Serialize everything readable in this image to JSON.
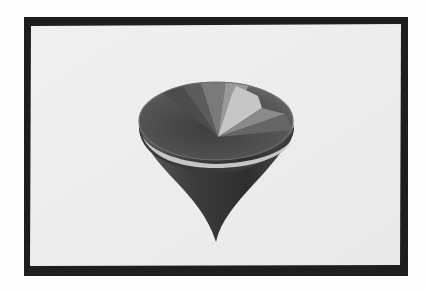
{
  "image": {
    "description": "Photograph of a CRT monitor displaying a computer-rendered shaded 3D spinning-top / cone shape",
    "subject": "shaded-cone-render"
  },
  "colors": {
    "background": "#fdfdfd",
    "frame": "#1e1e1e",
    "screen": "#eeeeee",
    "cone_dark": "#3a3a3a",
    "cone_mid": "#6a6a6a",
    "rim_highlight": "#d8d8d8",
    "wedge_light": "#b8b8b8",
    "wedge_lighter": "#cfcfcf"
  }
}
